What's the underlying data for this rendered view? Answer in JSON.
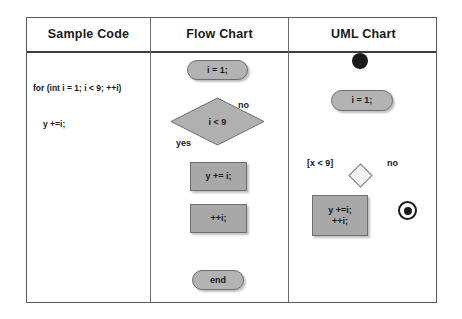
{
  "table": {
    "headers": [
      {
        "label": "Sample Code"
      },
      {
        "label": "Flow Chart"
      },
      {
        "label": "UML Chart"
      }
    ]
  },
  "sample_code": {
    "line1": "for (int i = 1; i < 9; ++i)",
    "line2": "y +=i;"
  },
  "flow_chart": {
    "start_node": "i = 1;",
    "decision": "i < 9",
    "decision_true_label": "yes",
    "decision_false_label": "no",
    "action_body": "y += i;",
    "action_increment": "++i;",
    "end_node": "end"
  },
  "uml_chart": {
    "start_node_icon": "filled-circle",
    "initial_action": "i = 1;",
    "guard_label": "[x < 9]",
    "decision_false_label": "no",
    "decision_icon": "diamond",
    "action_line1": "y +=i;",
    "action_line2": "++i;",
    "end_node_icon": "bullseye-circle"
  },
  "colors": {
    "shape_fill": "#a8a8a8",
    "terminal_fill": "#b3b3b3",
    "shape_stroke": "#6e6e6e",
    "line": "#4a4a4a",
    "text": "#1a1a1a",
    "table_border": "#5a5a5a"
  }
}
